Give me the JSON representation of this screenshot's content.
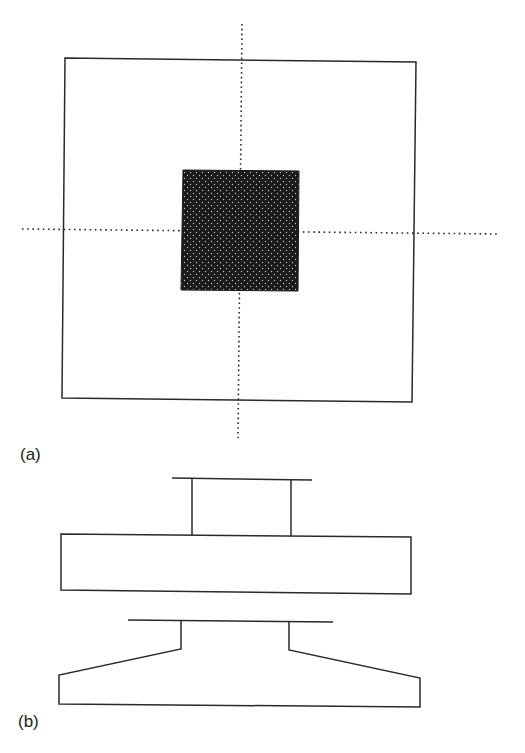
{
  "figure": {
    "panel_a": {
      "label": "(a)",
      "description": "Plan view: square footing (outer square) with shaded square column at center; dotted centerlines in both directions",
      "colors": {
        "outline": "#2a2a2a",
        "column_fill": "#1a1a1a",
        "column_dots": "#bfbfbf"
      }
    },
    "panel_b": {
      "label": "(b)",
      "description": "Elevation views: upper — column on rectangular (flat) footing slab; lower — column on sloped/tapered footing",
      "colors": {
        "outline": "#2a2a2a"
      }
    }
  }
}
